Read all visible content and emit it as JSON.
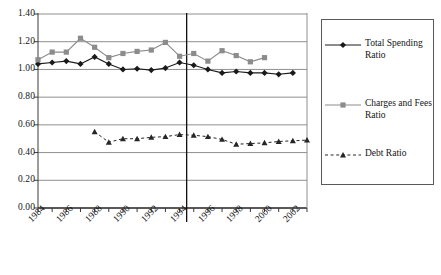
{
  "chart_data": {
    "type": "line",
    "title": "",
    "xlabel": "",
    "ylabel": "",
    "xlim": [
      1984,
      2003
    ],
    "ylim": [
      0.0,
      1.4
    ],
    "ytick_step": 0.2,
    "grid": true,
    "legend_position": "right",
    "x": [
      1984,
      1985,
      1986,
      1987,
      1988,
      1989,
      1990,
      1991,
      1992,
      1993,
      1994,
      1995,
      1996,
      1997,
      1998,
      1999,
      2000,
      2001,
      2002,
      2003
    ],
    "tick_labels": [
      "1984",
      "1986",
      "1988",
      "1990",
      "1992",
      "1994",
      "1996",
      "1998",
      "2000",
      "2002"
    ],
    "ytick_labels": [
      "0.00",
      "0.20",
      "0.40",
      "0.60",
      "0.80",
      "1.00",
      "1.20",
      "1.40"
    ],
    "annotations": [
      {
        "type": "vertical-line",
        "x": 1994.5,
        "label": ""
      }
    ],
    "series": [
      {
        "name": "Total Spending Ratio",
        "marker": "diamond",
        "line_style": "solid",
        "color": "#1a1a1a",
        "values": [
          1.04,
          1.05,
          1.06,
          1.04,
          1.09,
          1.04,
          1.0,
          1.005,
          0.995,
          1.01,
          1.05,
          1.03,
          1.0,
          0.975,
          0.985,
          0.975,
          0.975,
          0.965,
          0.975,
          null
        ]
      },
      {
        "name": "Charges and Fees Ratio",
        "marker": "square",
        "line_style": "solid",
        "color": "#8c8c8c",
        "values": [
          1.07,
          1.125,
          1.125,
          1.225,
          1.16,
          1.085,
          1.115,
          1.13,
          1.14,
          1.195,
          1.095,
          1.115,
          1.06,
          1.135,
          1.1,
          1.055,
          1.085,
          null,
          null,
          null
        ]
      },
      {
        "name": "Debt Ratio",
        "marker": "triangle",
        "line_style": "dashed",
        "color": "#262626",
        "values": [
          null,
          null,
          null,
          null,
          0.55,
          0.475,
          0.5,
          0.5,
          0.51,
          0.515,
          0.53,
          0.525,
          0.515,
          0.495,
          0.46,
          0.465,
          0.47,
          0.48,
          0.485,
          0.49
        ]
      }
    ]
  },
  "legend": {
    "items": [
      {
        "label": "Total Spending Ratio",
        "marker": "diamond",
        "line_style": "solid",
        "color": "#1a1a1a"
      },
      {
        "label": "Charges and Fees Ratio",
        "marker": "square",
        "line_style": "solid",
        "color": "#8c8c8c"
      },
      {
        "label": "Debt Ratio",
        "marker": "triangle",
        "line_style": "dashed",
        "color": "#262626"
      }
    ]
  }
}
